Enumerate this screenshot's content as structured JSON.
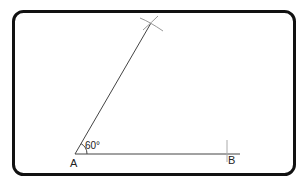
{
  "diagram": {
    "angle_label": "60°",
    "points": {
      "A": {
        "label": "A"
      },
      "B": {
        "label": "B"
      }
    },
    "colors": {
      "frame": "#111111",
      "lines": "#333333",
      "construction": "#999999"
    }
  }
}
